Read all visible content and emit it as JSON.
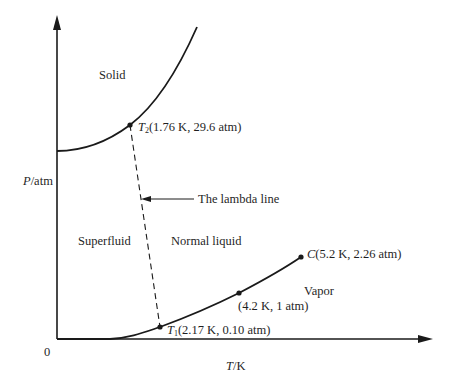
{
  "diagram": {
    "axes": {
      "y_label_var": "P",
      "y_label_unit": "/atm",
      "x_label_var": "T",
      "x_label_unit": "/K",
      "origin_label": "0"
    },
    "regions": {
      "solid": "Solid",
      "superfluid": "Superfluid",
      "normal_liquid": "Normal liquid",
      "vapor": "Vapor"
    },
    "annotations": {
      "lambda_line": "The lambda line"
    },
    "points": [
      {
        "id": "T2",
        "symbol": "T",
        "subscript": "2",
        "label": "(1.76 K, 29.6 atm)",
        "T_K": 1.76,
        "P_atm": 29.6
      },
      {
        "id": "T1",
        "symbol": "T",
        "subscript": "1",
        "label": "(2.17 K, 0.10 atm)",
        "T_K": 2.17,
        "P_atm": 0.1
      },
      {
        "id": "boiling",
        "symbol": "",
        "subscript": "",
        "label": "(4.2 K, 1 atm)",
        "T_K": 4.2,
        "P_atm": 1
      },
      {
        "id": "C",
        "symbol": "C",
        "subscript": "",
        "label": "(5.2 K, 2.26 atm)",
        "T_K": 5.2,
        "P_atm": 2.26
      }
    ],
    "colors": {
      "line": "#1a1a1a",
      "background": "#ffffff"
    }
  }
}
